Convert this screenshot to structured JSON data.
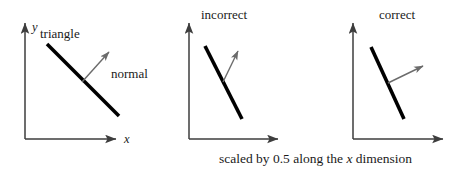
{
  "figure": {
    "caption": "scaled by 0.5 along the x dimension",
    "caption_parts": {
      "before": "scaled by 0.5 along the ",
      "italic": "x",
      "after": " dimension"
    },
    "colors": {
      "axis": "#3d3d3d",
      "triangle": "#000000",
      "normal": "#6b6b6b",
      "text": "#1a1a1a",
      "background": "#ffffff"
    }
  },
  "panels": [
    {
      "title": "",
      "axis_x_label": "x",
      "axis_y_label": "y",
      "triangle_label": "triangle",
      "normal_label": "normal",
      "geometry": {
        "origin": [
          25,
          139
        ],
        "x_axis_end": [
          120,
          139
        ],
        "y_axis_end": [
          25,
          20
        ],
        "triangle_start": [
          47,
          44
        ],
        "triangle_end": [
          119,
          116
        ],
        "normal_start": [
          82,
          82
        ],
        "normal_end": [
          112,
          49
        ]
      }
    },
    {
      "title": "incorrect",
      "axis_x_label": "",
      "axis_y_label": "",
      "triangle_label": "",
      "normal_label": "",
      "geometry": {
        "origin": [
          189,
          139
        ],
        "x_axis_end": [
          282,
          139
        ],
        "y_axis_end": [
          189,
          20
        ],
        "triangle_start": [
          205,
          46
        ],
        "triangle_end": [
          242,
          119
        ],
        "normal_start": [
          223,
          82
        ],
        "normal_end": [
          241,
          46
        ]
      }
    },
    {
      "title": "correct",
      "axis_x_label": "",
      "axis_y_label": "",
      "triangle_label": "",
      "normal_label": "",
      "geometry": {
        "origin": [
          353,
          139
        ],
        "x_axis_end": [
          447,
          139
        ],
        "y_axis_end": [
          353,
          20
        ],
        "triangle_start": [
          371,
          47
        ],
        "triangle_end": [
          404,
          119
        ],
        "normal_start": [
          388,
          83
        ],
        "normal_end": [
          427,
          64
        ]
      }
    }
  ]
}
